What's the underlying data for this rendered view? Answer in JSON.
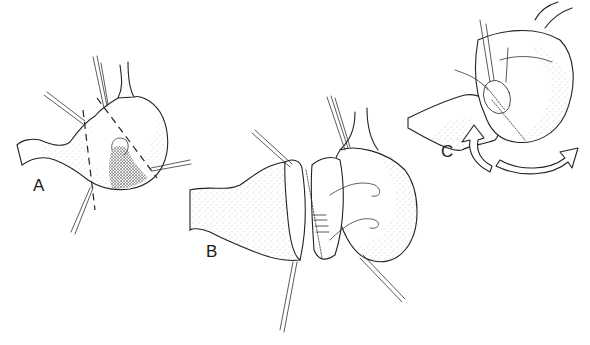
{
  "figure": {
    "panels": [
      {
        "id": "A",
        "label": "A",
        "label_pos": [
          33,
          177
        ]
      },
      {
        "id": "B",
        "label": "B",
        "label_pos": [
          206,
          243
        ]
      },
      {
        "id": "C",
        "label": "C",
        "label_pos": [
          441,
          143
        ]
      }
    ],
    "colors": {
      "ink": "#222222",
      "background": "#ffffff"
    }
  }
}
